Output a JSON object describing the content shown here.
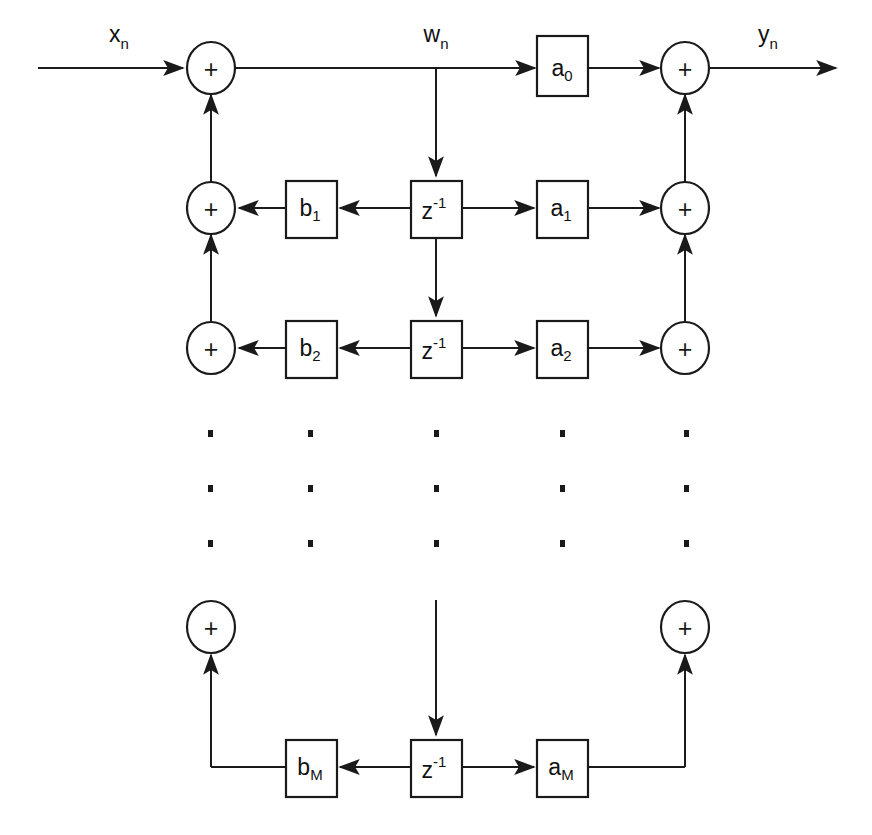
{
  "diagram": {
    "type": "signal-flow-block-diagram",
    "stroke_color": "#1a1a1a",
    "background_color": "#ffffff",
    "signals": {
      "input": "x",
      "input_sub": "n",
      "intermediate": "w",
      "intermediate_sub": "n",
      "output": "y",
      "output_sub": "n"
    },
    "adder_symbol": "+",
    "delay_label": "z",
    "delay_exponent": "-1",
    "rows": [
      {
        "index": 0,
        "feedback_coeff": null,
        "feedback_sub": null,
        "feedforward_coeff": "a",
        "feedforward_sub": "0",
        "delay": null
      },
      {
        "index": 1,
        "feedback_coeff": "b",
        "feedback_sub": "1",
        "feedforward_coeff": "a",
        "feedforward_sub": "1",
        "delay": "z",
        "delay_exponent": "-1"
      },
      {
        "index": 2,
        "feedback_coeff": "b",
        "feedback_sub": "2",
        "feedforward_coeff": "a",
        "feedforward_sub": "2",
        "delay": "z",
        "delay_exponent": "-1"
      },
      {
        "index": 3,
        "feedback_coeff": "b",
        "feedback_sub": "M",
        "feedforward_coeff": "a",
        "feedforward_sub": "M",
        "delay": "z",
        "delay_exponent": "-1"
      }
    ],
    "ellipsis": {
      "columns": 5,
      "dots_per_column": 3,
      "meaning": "continuation of intermediate filter taps"
    }
  }
}
